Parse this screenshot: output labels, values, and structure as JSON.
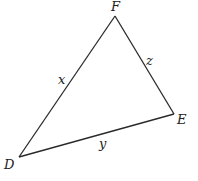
{
  "diagram": {
    "type": "triangle",
    "stroke_color": "#2a2a2a",
    "vertices": [
      {
        "name": "F",
        "x": 115,
        "y": 16,
        "label_x": 111,
        "label_y": 11
      },
      {
        "name": "E",
        "x": 174,
        "y": 114,
        "label_x": 177,
        "label_y": 124
      },
      {
        "name": "D",
        "x": 19,
        "y": 157,
        "label_x": 4,
        "label_y": 169
      }
    ],
    "sides": [
      {
        "name": "x",
        "from": "D",
        "to": "F",
        "label_x": 58,
        "label_y": 84
      },
      {
        "name": "y",
        "from": "D",
        "to": "E",
        "label_x": 99,
        "label_y": 148
      },
      {
        "name": "z",
        "from": "F",
        "to": "E",
        "label_x": 146,
        "label_y": 65
      }
    ]
  }
}
